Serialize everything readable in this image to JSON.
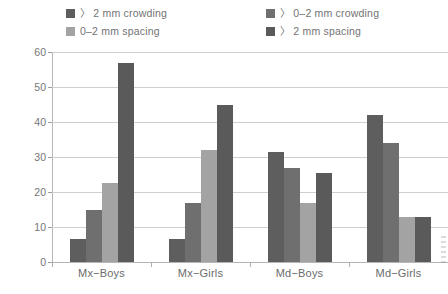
{
  "chart_data": {
    "type": "bar",
    "title": "",
    "xlabel": "",
    "ylabel": "Frequency(%)",
    "ylim": [
      0,
      60
    ],
    "ytick_values": [
      0,
      10,
      20,
      30,
      40,
      50,
      60
    ],
    "ytick_labels": [
      "0",
      "10",
      "20",
      "30",
      "40",
      "50",
      "60"
    ],
    "grid": "horizontal",
    "legend_position": "top",
    "categories": [
      "Mx−Boys",
      "Mx−Girls",
      "Md−Boys",
      "Md−Girls"
    ],
    "series": [
      {
        "name": "〉 2 mm crowding",
        "color": "#5e5e5e",
        "values": [
          6.5,
          6.5,
          31.5,
          42
        ]
      },
      {
        "name": "〉 0–2 mm crowding",
        "color": "#6f6f6f",
        "values": [
          15,
          17,
          27,
          34
        ]
      },
      {
        "name": "0–2 mm spacing",
        "color": "#a3a3a3",
        "values": [
          22.5,
          32,
          17,
          13
        ]
      },
      {
        "name": "〉 2 mm spacing",
        "color": "#5a5a5a",
        "values": [
          57,
          45,
          25.5,
          13
        ]
      }
    ]
  },
  "legend": {
    "items": [
      {
        "label": "〉 2 mm crowding",
        "color": "#5e5e5e"
      },
      {
        "label": "〉 0–2 mm crowding",
        "color": "#6f6f6f"
      },
      {
        "label": "0–2 mm spacing",
        "color": "#a3a3a3"
      },
      {
        "label": "〉 2 mm spacing",
        "color": "#5a5a5a"
      }
    ]
  },
  "axes": {
    "y_title": "Frequency(%)"
  }
}
